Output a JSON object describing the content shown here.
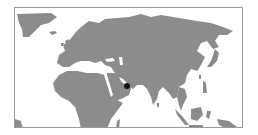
{
  "map": {
    "type": "locator-map",
    "projection": "equirectangular",
    "region_shown": "Europe, Africa, Asia",
    "colors": {
      "land": "#8c8c8c",
      "ocean": "#ffffff",
      "frame": "#9a9a9a",
      "marker": "#111111"
    },
    "marker": {
      "label": "",
      "approx_location": "Arabian Peninsula (UAE / Oman region)",
      "x": 126,
      "y": 85
    }
  }
}
